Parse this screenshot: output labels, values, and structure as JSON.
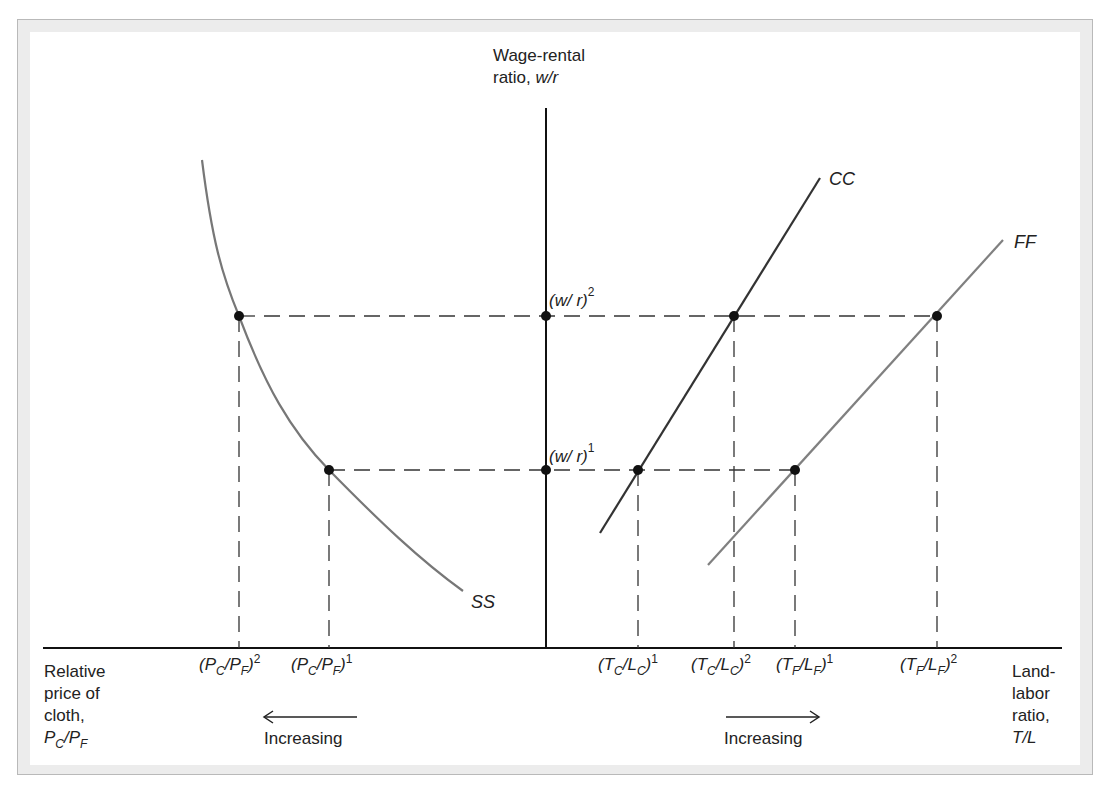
{
  "diagram": {
    "y_axis_label": [
      "Wage-rental",
      "ratio, w/r"
    ],
    "x_axis_left_label": [
      "Relative",
      "price of",
      "cloth,",
      "PC/PF"
    ],
    "x_axis_right_label": [
      "Land-",
      "labor",
      "ratio,",
      "T/L"
    ],
    "curves": [
      {
        "name": "SS",
        "label": "SS",
        "color": "#777777",
        "description": "downward-sloping convex curve in left panel"
      },
      {
        "name": "CC",
        "label": "CC",
        "color": "#333333",
        "description": "upward-sloping line in right panel"
      },
      {
        "name": "FF",
        "label": "FF",
        "color": "#808080",
        "description": "upward-sloping line in right panel, to the right of CC"
      }
    ],
    "y_levels": [
      {
        "label": "(w/r)",
        "superscript": "1"
      },
      {
        "label": "(w/r)",
        "superscript": "2"
      }
    ],
    "left_ticks": [
      {
        "base": "(P",
        "sub1": "C",
        "mid": "/P",
        "sub2": "F",
        "close": ")",
        "sup": "2"
      },
      {
        "base": "(P",
        "sub1": "C",
        "mid": "/P",
        "sub2": "F",
        "close": ")",
        "sup": "1"
      }
    ],
    "right_ticks": [
      {
        "base": "(T",
        "sub1": "C",
        "mid": "/L",
        "sub2": "C",
        "close": ")",
        "sup": "1"
      },
      {
        "base": "(T",
        "sub1": "C",
        "mid": "/L",
        "sub2": "C",
        "close": ")",
        "sup": "2"
      },
      {
        "base": "(T",
        "sub1": "F",
        "mid": "/L",
        "sub2": "F",
        "close": ")",
        "sup": "1"
      },
      {
        "base": "(T",
        "sub1": "F",
        "mid": "/L",
        "sub2": "F",
        "close": ")",
        "sup": "2"
      }
    ],
    "left_arrow_label": "Increasing",
    "right_arrow_label": "Increasing",
    "text": {
      "wage_rental": "Wage-rental",
      "ratio_wr_prefix": "ratio, ",
      "ratio_wr_ital": "w/r",
      "wr": "(w/ r)",
      "sup1": "1",
      "sup2": "2",
      "relative": "Relative",
      "price_of": "price of",
      "cloth": "cloth,",
      "land": "Land-",
      "labor": "labor",
      "ratio": "ratio,",
      "tl": "T/L",
      "ss": "SS",
      "cc": "CC",
      "ff": "FF",
      "increasing": "Increasing"
    },
    "colors": {
      "axis": "#111111",
      "dash": "#333333",
      "dot": "#111111",
      "frame_bg": "#ececec",
      "frame_border": "#b9b9b9"
    }
  }
}
